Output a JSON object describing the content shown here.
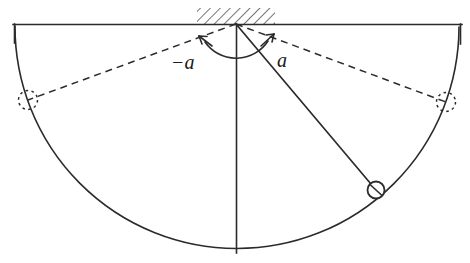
{
  "figure": {
    "background_color": "#ffffff",
    "stroke_color": "#2b2b2b",
    "width": 470,
    "height": 263
  },
  "labels": {
    "angle_negative": "−a",
    "angle_positive": "a"
  },
  "geometry": {
    "pivot": {
      "x": 236,
      "y": 24
    },
    "ceiling_line": {
      "x1": 13,
      "x2": 462,
      "y": 24
    },
    "ceiling_tick_left": {
      "x": 14,
      "y1": 24,
      "y2": 42
    },
    "ceiling_tick_right": {
      "x": 461,
      "y1": 24,
      "y2": 42
    },
    "hatch_region": {
      "x1": 197,
      "x2": 275,
      "y_top": 8,
      "y_bottom": 24
    },
    "vertical_axis": {
      "x": 236,
      "y1": 24,
      "y2": 253
    },
    "swing_arc": {
      "radius": 214,
      "start": {
        "x": 15,
        "y": 26
      },
      "bottom": {
        "x": 236,
        "y": 238
      },
      "end": {
        "x": 459,
        "y": 27
      }
    },
    "rod_solid": {
      "x1": 236,
      "y1": 24,
      "x2": 376,
      "y2": 190
    },
    "bob": {
      "cx": 376,
      "cy": 190,
      "r": 9
    },
    "rod_dashed_left": {
      "x1": 236,
      "y1": 24,
      "x2": 28,
      "y2": 100
    },
    "rod_dashed_right": {
      "x1": 236,
      "y1": 24,
      "x2": 446,
      "y2": 102
    },
    "bob_ghost_left": {
      "cx": 28,
      "cy": 100,
      "r": 9
    },
    "bob_ghost_right": {
      "cx": 446,
      "cy": 102,
      "r": 9
    },
    "angle_arc": {
      "radius": 38,
      "left_arrow": {
        "x": 202,
        "y": 40
      },
      "right_arrow": {
        "x": 270,
        "y": 38
      },
      "bottom": {
        "x": 236,
        "y": 62
      }
    },
    "label_negative_pos": {
      "x": 172,
      "y": 64
    },
    "label_positive_pos": {
      "x": 275,
      "y": 62
    }
  }
}
